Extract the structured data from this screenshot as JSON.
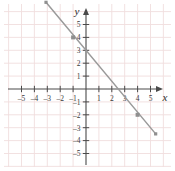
{
  "figure": {
    "axis_labels": {
      "x": "x",
      "y": "y"
    },
    "colors": {
      "grid": "#f0dede",
      "axis": "#4a4a4a",
      "line": "#9a9a9a",
      "point": "#8f8f8f",
      "text": "#3a3a3a",
      "background": "#ffffff"
    }
  },
  "chart_data": {
    "type": "line",
    "title": "",
    "xlabel": "x",
    "ylabel": "y",
    "xlim": [
      -6,
      6
    ],
    "ylim": [
      -6,
      6
    ],
    "grid": true,
    "legend": "none",
    "x_ticks": [
      -5,
      -4,
      -3,
      -2,
      -1,
      1,
      2,
      3,
      4,
      5
    ],
    "y_ticks": [
      -5,
      -4,
      -3,
      -2,
      -1,
      1,
      2,
      3,
      4,
      5
    ],
    "x_tick_labels": [
      "-5",
      "-4",
      "-3",
      "-2",
      "-1",
      "1",
      "2",
      "3",
      "4",
      "5"
    ],
    "y_tick_labels": [
      "-5",
      "-4",
      "-3",
      "-2",
      "-1",
      "1",
      "2",
      "3",
      "4",
      "5"
    ],
    "series": [
      {
        "name": "line",
        "equation": "y = -1.2x + 3",
        "slope": -1.2,
        "y_intercept": 3,
        "x_intercept": 2.5,
        "endpoints": [
          [
            -3.1,
            6.72
          ],
          [
            5.4,
            -3.48
          ]
        ],
        "marked_points": [
          [
            -1,
            4
          ],
          [
            4,
            -2
          ]
        ],
        "endpoint_markers": [
          [
            -3.1,
            6.72
          ],
          [
            5.4,
            -3.48
          ]
        ]
      }
    ]
  },
  "ticks": {
    "x": [
      {
        "label": "-5",
        "value": -5
      },
      {
        "label": "-4",
        "value": -4
      },
      {
        "label": "-3",
        "value": -3
      },
      {
        "label": "-2",
        "value": -2
      },
      {
        "label": "-1",
        "value": -1
      },
      {
        "label": "1",
        "value": 1
      },
      {
        "label": "2",
        "value": 2
      },
      {
        "label": "3",
        "value": 3
      },
      {
        "label": "4",
        "value": 4
      },
      {
        "label": "5",
        "value": 5
      }
    ],
    "y": [
      {
        "label": "5",
        "value": 5
      },
      {
        "label": "4",
        "value": 4
      },
      {
        "label": "3",
        "value": 3
      },
      {
        "label": "2",
        "value": 2
      },
      {
        "label": "1",
        "value": 1
      },
      {
        "label": "-1",
        "value": -1
      },
      {
        "label": "-2",
        "value": -2
      },
      {
        "label": "-3",
        "value": -3
      },
      {
        "label": "-4",
        "value": -4
      },
      {
        "label": "-5",
        "value": -5
      }
    ]
  }
}
